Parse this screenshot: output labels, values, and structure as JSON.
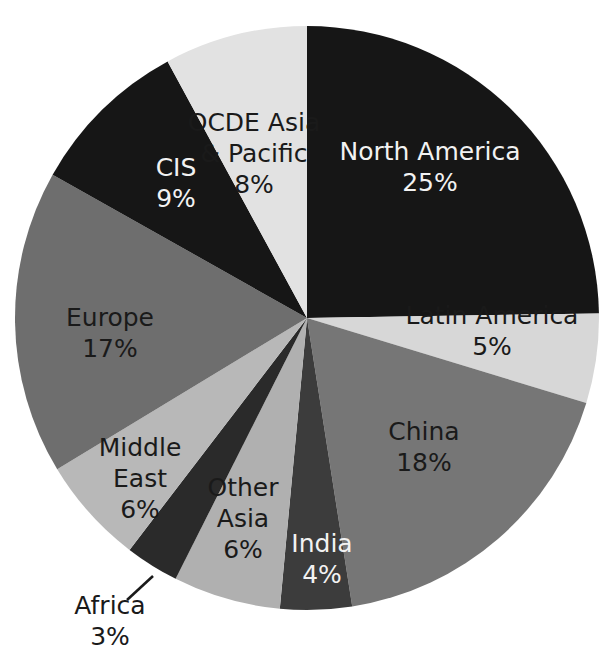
{
  "chart_data": {
    "type": "pie",
    "title": "",
    "subtitle": "",
    "xlabel": "",
    "ylabel": "",
    "legend_position": "none",
    "grid": false,
    "units": "percent",
    "start_angle_deg": 0,
    "direction": "clockwise",
    "total": 101,
    "categories": [
      "North America",
      "Latin America",
      "China",
      "India",
      "Other Asia",
      "Africa",
      "Middle East",
      "Europe",
      "CIS",
      "OCDE Asia & Pacific"
    ],
    "values": [
      25,
      5,
      18,
      4,
      6,
      3,
      6,
      17,
      9,
      8
    ],
    "value_labels": [
      "25%",
      "5%",
      "18%",
      "4%",
      "6%",
      "3%",
      "6%",
      "17%",
      "9%",
      "8%"
    ],
    "colors": [
      "#161616",
      "#d7d7d7",
      "#767676",
      "#3c3c3c",
      "#b0b0b0",
      "#2a2a2a",
      "#b8b8b8",
      "#6e6e6e",
      "#161616",
      "#e2e2e2"
    ],
    "slices": [
      {
        "name": "North America",
        "value": 25,
        "value_label": "25%",
        "color": "#161616",
        "label_lines": [
          "North America",
          "25%"
        ],
        "text_color": "light",
        "label_placement": "inside",
        "label_x": 430,
        "label_y": 168
      },
      {
        "name": "Latin America",
        "value": 5,
        "value_label": "5%",
        "color": "#d7d7d7",
        "label_lines": [
          "Latin America",
          "5%"
        ],
        "text_color": "dark",
        "label_placement": "inside",
        "label_x": 492,
        "label_y": 332
      },
      {
        "name": "China",
        "value": 18,
        "value_label": "18%",
        "color": "#767676",
        "label_lines": [
          "China",
          "18%"
        ],
        "text_color": "dark",
        "label_placement": "inside",
        "label_x": 424,
        "label_y": 448
      },
      {
        "name": "India",
        "value": 4,
        "value_label": "4%",
        "color": "#3c3c3c",
        "label_lines": [
          "India",
          "4%"
        ],
        "text_color": "light",
        "label_placement": "inside",
        "label_x": 322,
        "label_y": 560
      },
      {
        "name": "Other Asia",
        "value": 6,
        "value_label": "6%",
        "color": "#b0b0b0",
        "label_lines": [
          "Other",
          "Asia",
          "6%"
        ],
        "text_color": "dark",
        "label_placement": "inside",
        "label_x": 243,
        "label_y": 520
      },
      {
        "name": "Africa",
        "value": 3,
        "value_label": "3%",
        "color": "#2a2a2a",
        "label_lines": [
          "Africa",
          "3%"
        ],
        "text_color": "dark",
        "label_placement": "outside",
        "label_x": 110,
        "label_y": 622,
        "leader": {
          "x1": 153,
          "y1": 576,
          "x2": 127,
          "y2": 600
        }
      },
      {
        "name": "Middle East",
        "value": 6,
        "value_label": "6%",
        "color": "#b8b8b8",
        "label_lines": [
          "Middle",
          "East",
          "6%"
        ],
        "text_color": "dark",
        "label_placement": "inside",
        "label_x": 140,
        "label_y": 480
      },
      {
        "name": "Europe",
        "value": 17,
        "value_label": "17%",
        "color": "#6e6e6e",
        "label_lines": [
          "Europe",
          "17%"
        ],
        "text_color": "dark",
        "label_placement": "inside",
        "label_x": 110,
        "label_y": 334
      },
      {
        "name": "CIS",
        "value": 9,
        "value_label": "9%",
        "color": "#161616",
        "label_lines": [
          "CIS",
          "9%"
        ],
        "text_color": "light",
        "label_placement": "inside",
        "label_x": 176,
        "label_y": 184
      },
      {
        "name": "OCDE Asia & Pacific",
        "value": 8,
        "value_label": "8%",
        "color": "#e2e2e2",
        "label_lines": [
          "OCDE Asia",
          "& Pacific",
          "8%"
        ],
        "text_color": "dark",
        "label_placement": "inside",
        "label_x": 254,
        "label_y": 155
      }
    ],
    "geometry": {
      "center_x": 307,
      "center_y": 318,
      "radius": 292
    },
    "background_color": "#ffffff"
  }
}
